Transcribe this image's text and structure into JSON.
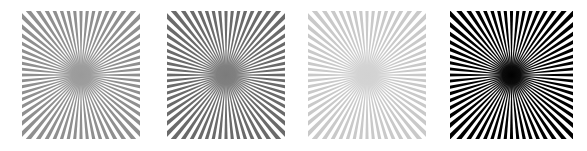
{
  "figure": {
    "background_color": "#ffffff",
    "width": 587,
    "height": 151,
    "kind": "radial-starburst-contrast-series",
    "panel_count": 4
  },
  "panels": [
    {
      "id": "panel-1",
      "label": "starburst-medium-contrast",
      "x": 22,
      "y": 11,
      "width": 118,
      "height": 128,
      "ray_count": 64,
      "ray_color": "#8f8f8f",
      "background_color": "#ffffff",
      "center_color": "#9a9a9a",
      "center_radius": 26,
      "contrast_level": "medium",
      "blur": 0.55
    },
    {
      "id": "panel-2",
      "label": "starburst-high-contrast",
      "x": 167,
      "y": 11,
      "width": 118,
      "height": 128,
      "ray_count": 64,
      "ray_color": "#6a6a6a",
      "background_color": "#ffffff",
      "center_color": "#7b7b7b",
      "center_radius": 26,
      "contrast_level": "high",
      "blur": 0.55
    },
    {
      "id": "panel-3",
      "label": "starburst-low-contrast",
      "x": 308,
      "y": 11,
      "width": 118,
      "height": 128,
      "ray_count": 64,
      "ray_color": "#c9c9c9",
      "background_color": "#ffffff",
      "center_color": "#d2d2d2",
      "center_radius": 26,
      "contrast_level": "low",
      "blur": 0.55
    },
    {
      "id": "panel-4",
      "label": "starburst-full-contrast",
      "x": 450,
      "y": 11,
      "width": 123,
      "height": 128,
      "ray_count": 64,
      "ray_color": "#050505",
      "background_color": "#ffffff",
      "center_color": "#000000",
      "center_radius": 24,
      "contrast_level": "full",
      "blur": 0.45
    }
  ],
  "chart_data": {
    "type": "heatmap",
    "title": "",
    "subtitle": "",
    "xlabel": "",
    "ylabel": "",
    "legend_position": "none",
    "grid": false,
    "categories": [
      "medium contrast",
      "high contrast",
      "low contrast",
      "full contrast"
    ],
    "series": [
      {
        "name": "ray gray level (0-255)",
        "values": [
          143,
          106,
          201,
          5
        ]
      },
      {
        "name": "background gray level (0-255)",
        "values": [
          255,
          255,
          255,
          255
        ]
      },
      {
        "name": "michelson contrast",
        "values": [
          0.28,
          0.41,
          0.12,
          0.96
        ]
      },
      {
        "name": "ray count",
        "values": [
          64,
          64,
          64,
          64
        ]
      }
    ],
    "annotations": [
      "Center of each star is blurred / aliased where the angular spatial frequency exceeds sampling resolution",
      "All four panels share identical geometry and differ only in ray-to-background contrast"
    ]
  }
}
